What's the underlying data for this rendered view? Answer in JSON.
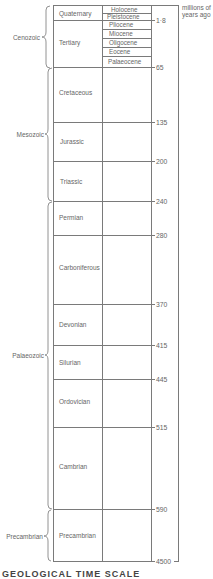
{
  "units_label": [
    "millions of",
    "years ago"
  ],
  "eras": [
    {
      "name": "Cenozoic",
      "y_top": 5,
      "y_bottom": 67
    },
    {
      "name": "Mesozoic",
      "y_top": 67,
      "y_bottom": 201
    },
    {
      "name": "Palaeozoic",
      "y_top": 201,
      "y_bottom": 509
    },
    {
      "name": "Precambrian",
      "y_top": 509,
      "y_bottom": 561
    }
  ],
  "periods": [
    {
      "name": "Quaternary",
      "y_top": 5,
      "y_bottom": 20
    },
    {
      "name": "Tertiary",
      "y_top": 20,
      "y_bottom": 67
    },
    {
      "name": "Cretaceous",
      "y_top": 67,
      "y_bottom": 122
    },
    {
      "name": "Jurassic",
      "y_top": 122,
      "y_bottom": 161
    },
    {
      "name": "Triassic",
      "y_top": 161,
      "y_bottom": 201
    },
    {
      "name": "Permian",
      "y_top": 201,
      "y_bottom": 235
    },
    {
      "name": "Carboniferous",
      "y_top": 235,
      "y_bottom": 304
    },
    {
      "name": "Devonian",
      "y_top": 304,
      "y_bottom": 345
    },
    {
      "name": "Silurian",
      "y_top": 345,
      "y_bottom": 379
    },
    {
      "name": "Ordovician",
      "y_top": 379,
      "y_bottom": 427
    },
    {
      "name": "Cambrian",
      "y_top": 427,
      "y_bottom": 509
    },
    {
      "name": "Precambrian",
      "y_top": 509,
      "y_bottom": 561
    }
  ],
  "epochs": [
    "Holocene",
    "Pleistocene",
    "Pliocene",
    "Miocene",
    "Oligocene",
    "Eocene",
    "Palaeocene"
  ],
  "boundaries": [
    {
      "value": "1·8",
      "y": 20
    },
    {
      "value": "65",
      "y": 67
    },
    {
      "value": "135",
      "y": 122
    },
    {
      "value": "200",
      "y": 161
    },
    {
      "value": "240",
      "y": 201
    },
    {
      "value": "280",
      "y": 235
    },
    {
      "value": "370",
      "y": 304
    },
    {
      "value": "415",
      "y": 345
    },
    {
      "value": "445",
      "y": 379
    },
    {
      "value": "515",
      "y": 427
    },
    {
      "value": "590",
      "y": 509
    },
    {
      "value": "4500",
      "y": 561
    }
  ],
  "heading": "GEOLOGICAL TIME SCALE"
}
